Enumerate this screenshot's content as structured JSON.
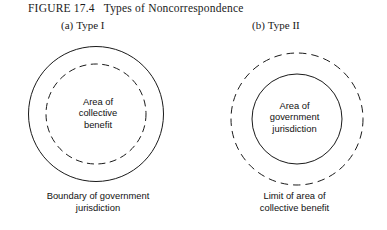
{
  "figure": {
    "number": "FIGURE  17.4",
    "title": "Types of Noncorrespondence"
  },
  "panels": [
    {
      "tag": "(a)",
      "label": "Type I",
      "outer_circle": {
        "style": "solid",
        "color": "#1a1a1a"
      },
      "inner_circle": {
        "style": "dashed",
        "color": "#1a1a1a"
      },
      "inner_label": [
        "Area of",
        "collective",
        "benefit"
      ],
      "bottom_caption": [
        "Boundary of government",
        "jurisdiction"
      ]
    },
    {
      "tag": "(b)",
      "label": "Type II",
      "outer_circle": {
        "style": "dashed",
        "color": "#1a1a1a"
      },
      "inner_circle": {
        "style": "solid",
        "color": "#1a1a1a"
      },
      "inner_label": [
        "Area of",
        "government",
        "jurisdiction"
      ],
      "bottom_caption": [
        "Limit of area of",
        "collective benefit"
      ]
    }
  ],
  "page": {
    "background_color": "#ffffff",
    "ink_color": "#1a1a1a"
  }
}
